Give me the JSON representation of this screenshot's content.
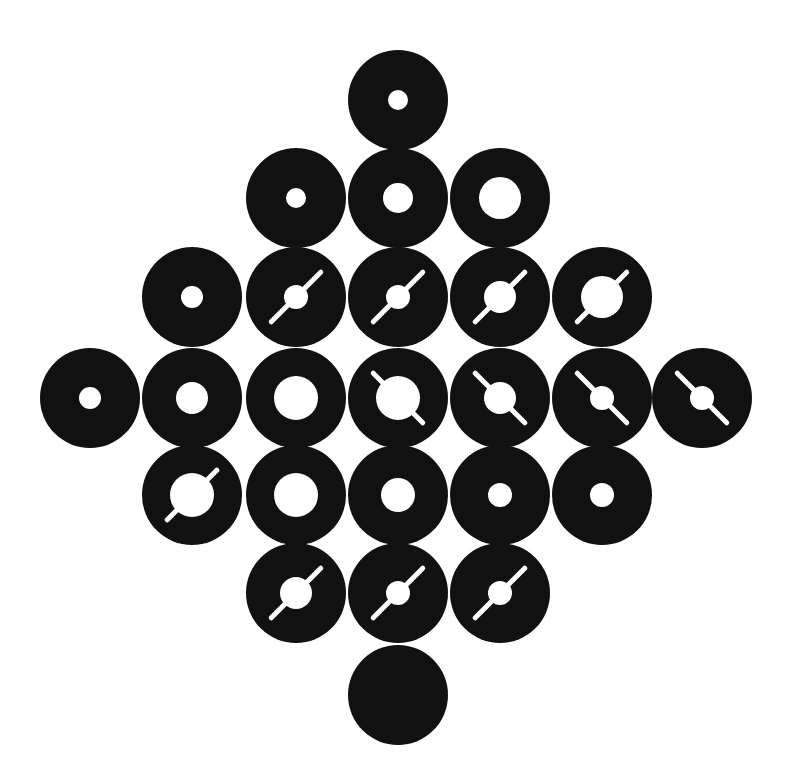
{
  "diagram": {
    "title": "",
    "background": "#ffffff",
    "disc_color": "#111111",
    "hole_color": "#ffffff",
    "disc_radius": 50,
    "slit_half_length": 35,
    "slit_width": 5,
    "discs": [
      {
        "row": 0,
        "cx": 398,
        "cy": 100,
        "hole_r": 10,
        "slit": "none"
      },
      {
        "row": 1,
        "cx": 296,
        "cy": 198,
        "hole_r": 10,
        "slit": "none"
      },
      {
        "row": 1,
        "cx": 398,
        "cy": 198,
        "hole_r": 15,
        "slit": "none"
      },
      {
        "row": 1,
        "cx": 500,
        "cy": 198,
        "hole_r": 21,
        "slit": "none"
      },
      {
        "row": 2,
        "cx": 192,
        "cy": 297,
        "hole_r": 11,
        "slit": "none"
      },
      {
        "row": 2,
        "cx": 296,
        "cy": 297,
        "hole_r": 12,
        "slit": "ne-sw"
      },
      {
        "row": 2,
        "cx": 398,
        "cy": 297,
        "hole_r": 12,
        "slit": "ne-sw"
      },
      {
        "row": 2,
        "cx": 500,
        "cy": 297,
        "hole_r": 16,
        "slit": "ne-sw"
      },
      {
        "row": 2,
        "cx": 602,
        "cy": 297,
        "hole_r": 21,
        "slit": "ne-sw"
      },
      {
        "row": 3,
        "cx": 90,
        "cy": 398,
        "hole_r": 11,
        "slit": "none"
      },
      {
        "row": 3,
        "cx": 192,
        "cy": 398,
        "hole_r": 16,
        "slit": "none"
      },
      {
        "row": 3,
        "cx": 296,
        "cy": 398,
        "hole_r": 22,
        "slit": "none"
      },
      {
        "row": 3,
        "cx": 398,
        "cy": 398,
        "hole_r": 22,
        "slit": "nw-se"
      },
      {
        "row": 3,
        "cx": 500,
        "cy": 398,
        "hole_r": 16,
        "slit": "nw-se"
      },
      {
        "row": 3,
        "cx": 602,
        "cy": 398,
        "hole_r": 12,
        "slit": "nw-se"
      },
      {
        "row": 3,
        "cx": 702,
        "cy": 398,
        "hole_r": 12,
        "slit": "nw-se"
      },
      {
        "row": 4,
        "cx": 192,
        "cy": 495,
        "hole_r": 22,
        "slit": "ne-sw"
      },
      {
        "row": 4,
        "cx": 296,
        "cy": 495,
        "hole_r": 22,
        "slit": "none"
      },
      {
        "row": 4,
        "cx": 398,
        "cy": 495,
        "hole_r": 17,
        "slit": "none"
      },
      {
        "row": 4,
        "cx": 500,
        "cy": 495,
        "hole_r": 12,
        "slit": "none"
      },
      {
        "row": 4,
        "cx": 602,
        "cy": 495,
        "hole_r": 12,
        "slit": "none"
      },
      {
        "row": 5,
        "cx": 296,
        "cy": 593,
        "hole_r": 16,
        "slit": "ne-sw"
      },
      {
        "row": 5,
        "cx": 398,
        "cy": 593,
        "hole_r": 12,
        "slit": "ne-sw"
      },
      {
        "row": 5,
        "cx": 500,
        "cy": 593,
        "hole_r": 12,
        "slit": "ne-sw"
      },
      {
        "row": 6,
        "cx": 398,
        "cy": 695,
        "hole_r": 0,
        "slit": "none"
      }
    ]
  }
}
